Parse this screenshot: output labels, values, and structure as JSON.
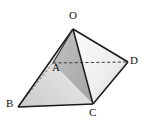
{
  "figure": {
    "type": "geometric-solid-diagram",
    "background_color": "#ffffff",
    "stroke_color": "#1a1a1a",
    "hidden_edge_color": "#4a4a4a",
    "canvas": {
      "width": 146,
      "height": 125
    }
  },
  "vertices": [
    {
      "id": "O",
      "label": "O",
      "x": 73,
      "y": 29,
      "label_x": 69,
      "label_y": 12,
      "hidden": false,
      "role": "apex"
    },
    {
      "id": "A",
      "label": "A",
      "x": 53,
      "y": 63,
      "label_x": 52,
      "label_y": 63,
      "hidden": true,
      "role": "base-back-left"
    },
    {
      "id": "B",
      "label": "B",
      "x": 18,
      "y": 107,
      "label_x": 5,
      "label_y": 99,
      "hidden": false,
      "role": "base-front-left"
    },
    {
      "id": "C",
      "label": "C",
      "x": 93,
      "y": 104,
      "label_x": 89,
      "label_y": 106,
      "hidden": false,
      "role": "base-front-right"
    },
    {
      "id": "D",
      "label": "D",
      "x": 128,
      "y": 62,
      "label_x": 130,
      "label_y": 55,
      "hidden": false,
      "role": "base-back-right"
    }
  ],
  "edges": [
    {
      "id": "OB",
      "from": "O",
      "to": "B",
      "style": "solid"
    },
    {
      "id": "OC",
      "from": "O",
      "to": "C",
      "style": "solid"
    },
    {
      "id": "OD",
      "from": "O",
      "to": "D",
      "style": "solid"
    },
    {
      "id": "OA",
      "from": "O",
      "to": "A",
      "style": "solid"
    },
    {
      "id": "BC",
      "from": "B",
      "to": "C",
      "style": "solid"
    },
    {
      "id": "CD",
      "from": "C",
      "to": "D",
      "style": "solid"
    },
    {
      "id": "AD",
      "from": "A",
      "to": "D",
      "style": "dashed"
    },
    {
      "id": "AB",
      "from": "A",
      "to": "B",
      "style": "dashed"
    }
  ],
  "faces": [
    {
      "id": "OAB",
      "vertices": [
        "O",
        "A",
        "B"
      ],
      "shade": "#d8d8d8",
      "name": "left-face"
    },
    {
      "id": "OAC",
      "vertices": [
        "O",
        "A",
        "C"
      ],
      "shade": "#b4b4b4",
      "name": "front-center-face"
    },
    {
      "id": "ABC",
      "vertices": [
        "A",
        "B",
        "C"
      ],
      "shade": "#dcdcdc",
      "name": "base-front-triangle"
    },
    {
      "id": "OCD",
      "vertices": [
        "O",
        "C",
        "D"
      ],
      "shade": "#e6e6e6",
      "name": "right-face"
    }
  ],
  "gradients": {
    "left_face_light": "#f2f2f2",
    "left_face_dark": "#c4c4c4",
    "center_face_light": "#c8c8c8",
    "center_face_dark": "#a8a8a8",
    "right_face_light": "#fafafa",
    "right_face_dark": "#d0d0d0"
  }
}
